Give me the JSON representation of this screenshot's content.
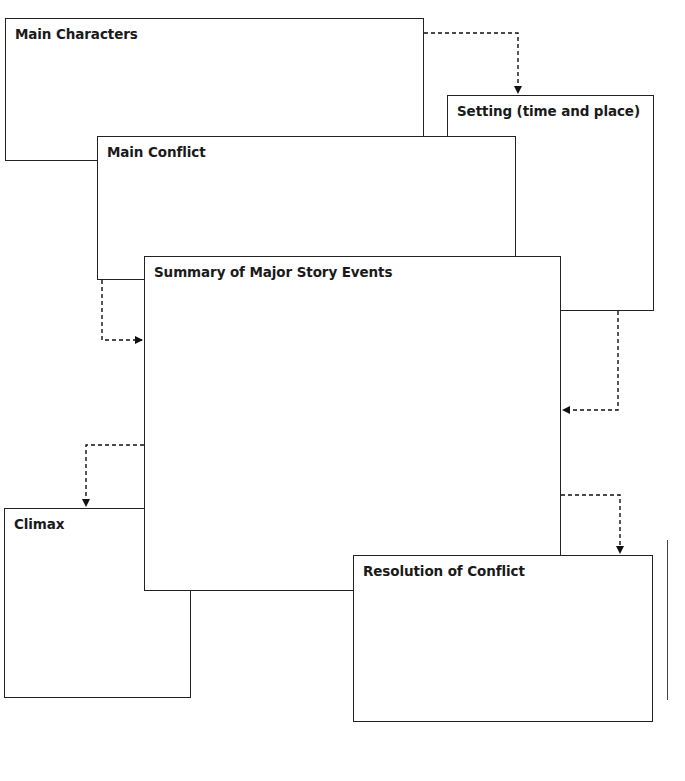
{
  "diagram": {
    "type": "story-map-graphic-organizer",
    "boxes": [
      {
        "id": "main-characters",
        "label": "Main Characters"
      },
      {
        "id": "setting",
        "label": "Setting (time and place)"
      },
      {
        "id": "main-conflict",
        "label": "Main Conflict"
      },
      {
        "id": "summary",
        "label": "Summary of Major Story Events"
      },
      {
        "id": "climax",
        "label": "Climax"
      },
      {
        "id": "resolution",
        "label": "Resolution of Conflict"
      }
    ],
    "arrows": [
      {
        "from": "main-characters",
        "to": "setting",
        "style": "dashed"
      },
      {
        "from": "main-conflict",
        "to": "summary",
        "style": "dashed"
      },
      {
        "from": "setting",
        "to": "summary",
        "style": "dashed"
      },
      {
        "from": "summary",
        "to": "climax",
        "style": "dashed"
      },
      {
        "from": "summary",
        "to": "resolution",
        "style": "dashed"
      }
    ]
  },
  "footer": {
    "copyright": "All rights reserved"
  }
}
